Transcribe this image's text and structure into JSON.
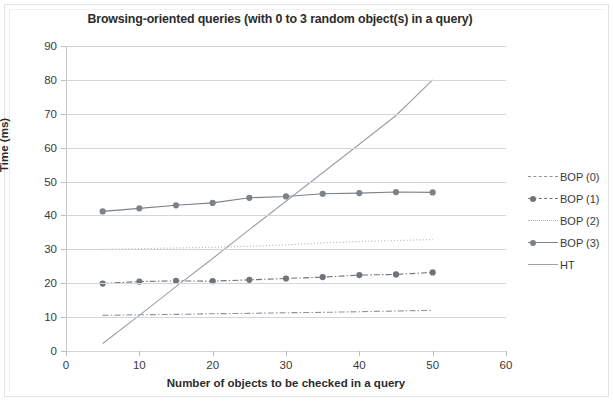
{
  "chart_data": {
    "type": "line",
    "title": "Browsing-oriented queries (with 0 to 3 random object(s) in a query)",
    "xlabel": "Number of objects to be checked in a query",
    "ylabel": "Time (ms)",
    "xlim": [
      0,
      60
    ],
    "ylim": [
      0,
      90
    ],
    "xticks": [
      0,
      10,
      20,
      30,
      40,
      50,
      60
    ],
    "yticks": [
      0,
      10,
      20,
      30,
      40,
      50,
      60,
      70,
      80,
      90
    ],
    "grid": "horizontal",
    "legend_position": "right",
    "x": [
      5,
      10,
      15,
      20,
      25,
      30,
      35,
      40,
      45,
      50
    ],
    "series": [
      {
        "name": "BOP (0)",
        "style": "dash-dot",
        "marker": "none",
        "color": "#8e9398",
        "values": [
          10.5,
          10.7,
          10.8,
          11.0,
          11.1,
          11.3,
          11.4,
          11.6,
          11.8,
          12.0
        ]
      },
      {
        "name": "BOP (1)",
        "style": "dash-dot",
        "marker": "circle",
        "color": "#6f7478",
        "values": [
          19.9,
          20.5,
          20.7,
          20.6,
          21.0,
          21.4,
          21.8,
          22.4,
          22.6,
          23.2
        ]
      },
      {
        "name": "BOP (2)",
        "style": "dotted",
        "marker": "none",
        "color": "#b3b7bb",
        "values": [
          30.0,
          30.2,
          30.4,
          30.6,
          30.9,
          31.3,
          31.9,
          32.3,
          32.6,
          32.9
        ]
      },
      {
        "name": "BOP (3)",
        "style": "solid",
        "marker": "circle",
        "color": "#7d8287",
        "values": [
          41.2,
          42.1,
          43.0,
          43.7,
          45.2,
          45.6,
          46.4,
          46.6,
          46.9,
          46.8
        ]
      },
      {
        "name": "HT",
        "style": "solid",
        "marker": "none",
        "color": "#9aa0a5",
        "values": [
          2.2,
          10.5,
          19.0,
          27.3,
          35.8,
          44.2,
          52.6,
          61.0,
          69.5,
          80.0
        ]
      }
    ]
  },
  "legend": {
    "items": [
      {
        "label": "BOP (0)"
      },
      {
        "label": "BOP (1)"
      },
      {
        "label": "BOP (2)"
      },
      {
        "label": "BOP (3)"
      },
      {
        "label": "HT"
      }
    ]
  }
}
